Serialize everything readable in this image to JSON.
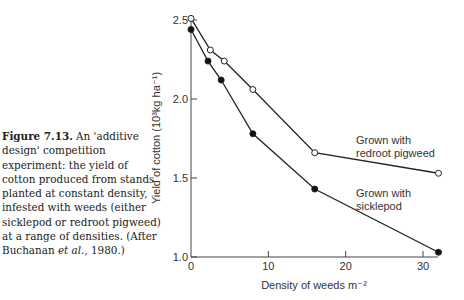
{
  "caption": {
    "figure_label": "Figure 7.13.",
    "text_before_et_al": " An 'additive design' competition experiment: the yield of cotton produced from stands planted at constant density, infested with weeds (either sicklepod or redroot pigweed) at a range of densities. (After Buchanan ",
    "et_al": "et al.",
    "text_after_et_al": ", 1980.)"
  },
  "chart_data": {
    "type": "line",
    "title": "",
    "xlabel": "Density of weeds m⁻²",
    "ylabel": "Yield of cotton (10³kg ha⁻¹)",
    "xlim": [
      0,
      32
    ],
    "ylim": [
      1.0,
      2.5
    ],
    "x_ticks": [
      "0",
      "10",
      "20",
      "30"
    ],
    "y_ticks": [
      "1.0",
      "1.5",
      "2.0",
      "2.5"
    ],
    "grid": false,
    "legend": "inline labels near line ends",
    "series": [
      {
        "name": "Grown with redroot pigweed",
        "marker": "open circle",
        "x": [
          0,
          2.5,
          4.3,
          8,
          16,
          32
        ],
        "y": [
          2.51,
          2.31,
          2.24,
          2.06,
          1.66,
          1.53
        ]
      },
      {
        "name": "Grown with sicklepod",
        "marker": "filled circle",
        "x": [
          0,
          2.2,
          3.9,
          8,
          16,
          32
        ],
        "y": [
          2.44,
          2.24,
          2.12,
          1.78,
          1.43,
          1.03
        ]
      }
    ],
    "annotations": [
      {
        "text_line1": "Grown with",
        "text_line2": "redroot pigweed"
      },
      {
        "text_line1": "Grown with",
        "text_line2": "sicklepod"
      }
    ]
  }
}
